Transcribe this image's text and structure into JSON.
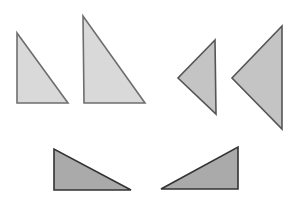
{
  "diagram": {
    "width": 299,
    "height": 205,
    "background": "#ffffff",
    "stroke_width": 1.6,
    "groups": [
      {
        "name": "top-left-pair",
        "fill": "#d9d9d9",
        "stroke": "#6e6e6e",
        "triangles": [
          {
            "name": "small-right-triangle-up",
            "points": "17,33 17,103 68,103"
          },
          {
            "name": "large-right-triangle-up",
            "points": "83,16 84,103 145,103"
          }
        ]
      },
      {
        "name": "top-right-pair",
        "fill": "#c4c4c4",
        "stroke": "#555555",
        "triangles": [
          {
            "name": "small-triangle-pointing-left",
            "points": "215,40 178,78 216,114"
          },
          {
            "name": "large-triangle-pointing-left",
            "points": "282,26 232,78 282,129"
          }
        ]
      },
      {
        "name": "bottom-pair",
        "fill": "#aaaaaa",
        "stroke": "#333333",
        "triangles": [
          {
            "name": "right-triangle-facing-right",
            "points": "54,149 54,190 131,190"
          },
          {
            "name": "right-triangle-facing-left",
            "points": "238,147 238,189 161,189"
          }
        ]
      }
    ]
  }
}
